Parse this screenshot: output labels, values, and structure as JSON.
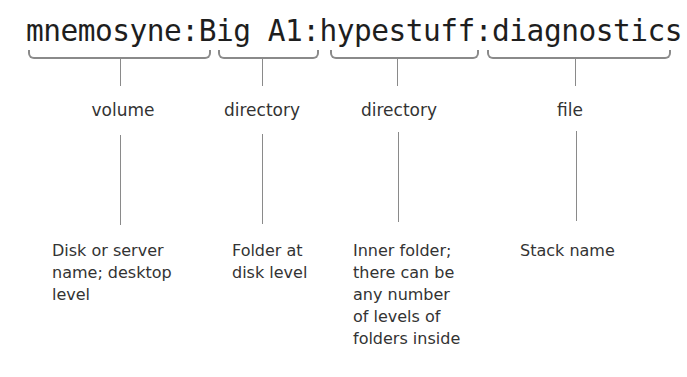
{
  "path": {
    "segments": [
      {
        "text": "mnemosyne",
        "separator": ":"
      },
      {
        "text": "Big A1",
        "separator": ":"
      },
      {
        "text": "hypestuff",
        "separator": ":"
      },
      {
        "text": "diagnostics",
        "separator": ""
      }
    ]
  },
  "parts": [
    {
      "label": "volume",
      "description": [
        "Disk or server",
        "name; desktop",
        "level"
      ]
    },
    {
      "label": "directory",
      "description": [
        "Folder at",
        "disk level"
      ]
    },
    {
      "label": "directory",
      "description": [
        "Inner folder;",
        "there can be",
        "any number",
        "of levels of",
        "folders inside"
      ]
    },
    {
      "label": "file",
      "description": [
        "Stack name"
      ]
    }
  ]
}
